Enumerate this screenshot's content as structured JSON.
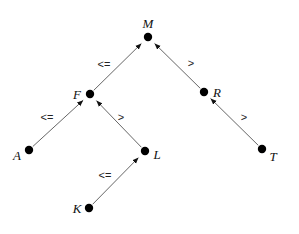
{
  "diagram": {
    "type": "binary-search-tree",
    "nodes": [
      {
        "id": "M",
        "label": "M",
        "x": 148,
        "y": 37,
        "lx": 148,
        "ly": 28,
        "anchor": "middle"
      },
      {
        "id": "F",
        "label": "F",
        "x": 90,
        "y": 94,
        "lx": 77,
        "ly": 99,
        "anchor": "middle"
      },
      {
        "id": "R",
        "label": "R",
        "x": 204,
        "y": 92,
        "lx": 217,
        "ly": 97,
        "anchor": "middle"
      },
      {
        "id": "A",
        "label": "A",
        "x": 29,
        "y": 150,
        "lx": 17,
        "ly": 160,
        "anchor": "middle"
      },
      {
        "id": "L",
        "label": "L",
        "x": 145,
        "y": 151,
        "lx": 157,
        "ly": 159,
        "anchor": "middle"
      },
      {
        "id": "T",
        "label": "T",
        "x": 262,
        "y": 149,
        "lx": 273,
        "ly": 161,
        "anchor": "middle"
      },
      {
        "id": "K",
        "label": "K",
        "x": 89,
        "y": 208,
        "lx": 77,
        "ly": 213,
        "anchor": "middle"
      }
    ],
    "edges": [
      {
        "from": "F",
        "to": "M",
        "label": "<=",
        "lx": 104,
        "ly": 68
      },
      {
        "from": "R",
        "to": "M",
        "label": ">",
        "lx": 191,
        "ly": 67
      },
      {
        "from": "A",
        "to": "F",
        "label": "<=",
        "lx": 47,
        "ly": 121
      },
      {
        "from": "L",
        "to": "F",
        "label": ">",
        "lx": 121,
        "ly": 121
      },
      {
        "from": "T",
        "to": "R",
        "label": ">",
        "lx": 244,
        "ly": 121
      },
      {
        "from": "K",
        "to": "L",
        "label": "<=",
        "lx": 105,
        "ly": 179
      }
    ]
  }
}
